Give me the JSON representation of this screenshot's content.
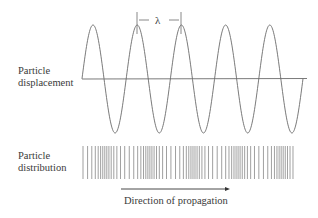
{
  "labels": {
    "displacement_line1": "Particle",
    "displacement_line2": "displacement",
    "distribution_line1": "Particle",
    "distribution_line2": "distribution",
    "wavelength_symbol": "λ",
    "direction": "Direction of propagation"
  },
  "wave": {
    "baseline_y": 79,
    "amplitude": 54,
    "start_x": 82,
    "end_x": 303,
    "first_peak_x": 93,
    "wavelength_px": 44.2,
    "stroke_color": "#6b6b6b",
    "peaks_x": [
      93,
      137,
      181,
      226,
      270
    ],
    "troughs_x": [
      115,
      159,
      204,
      248,
      292
    ]
  },
  "axis": {
    "x1": 82,
    "x2": 307,
    "y": 79,
    "color": "#6b6b6b"
  },
  "wavelength_marker": {
    "x1": 137,
    "x2": 181,
    "top_y": 12,
    "bottom_y": 34
  },
  "distribution": {
    "x_start": 83,
    "x_end": 293,
    "y_top": 146,
    "y_bottom": 179,
    "color": "#777777"
  },
  "arrow": {
    "x1": 121,
    "x2": 230,
    "y": 189,
    "color": "#333333"
  },
  "colors": {
    "line": "#6b6b6b",
    "text": "#3a3a3a"
  }
}
